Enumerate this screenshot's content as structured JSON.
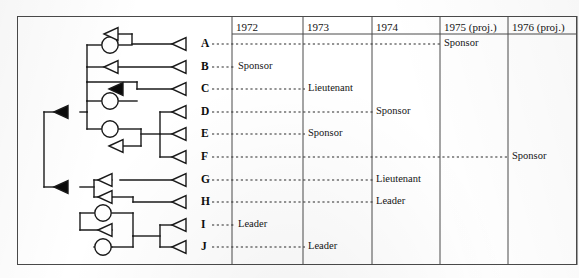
{
  "figure": {
    "type": "tree-timeline-diagram"
  },
  "table": {
    "columns": [
      {
        "label": "1972",
        "x0": 232,
        "x1": 303
      },
      {
        "label": "1973",
        "x0": 303,
        "x1": 372
      },
      {
        "label": "1974",
        "x0": 372,
        "x1": 440
      },
      {
        "label": "1975 (proj.)",
        "x0": 440,
        "x1": 508
      },
      {
        "label": "1976 (proj.)",
        "x0": 508,
        "x1": 577
      }
    ],
    "header_y": 16,
    "header_bottom_y": 34
  },
  "rows": [
    {
      "letter": "A",
      "y": 44,
      "label": "Sponsor",
      "label_x": 444,
      "dot_end": 441
    },
    {
      "letter": "B",
      "y": 67,
      "label": "Sponsor",
      "label_x": 238,
      "dot_end": 235
    },
    {
      "letter": "C",
      "y": 89,
      "label": "Lieutenant",
      "label_x": 308,
      "dot_end": 305
    },
    {
      "letter": "D",
      "y": 112,
      "label": "Sponsor",
      "label_x": 376,
      "dot_end": 373
    },
    {
      "letter": "E",
      "y": 134,
      "label": "Sponsor",
      "label_x": 308,
      "dot_end": 305
    },
    {
      "letter": "F",
      "y": 157,
      "label": "Sponsor",
      "label_x": 512,
      "dot_end": 509
    },
    {
      "letter": "G",
      "y": 180,
      "label": "Lieutenant",
      "label_x": 376,
      "dot_end": 373
    },
    {
      "letter": "H",
      "y": 202,
      "label": "Leader",
      "label_x": 376,
      "dot_end": 373
    },
    {
      "letter": "I",
      "y": 225,
      "label": "Leader",
      "label_x": 238,
      "dot_end": 235
    },
    {
      "letter": "J",
      "y": 247,
      "label": "Leader",
      "label_x": 308,
      "dot_end": 305
    }
  ],
  "nodes": {
    "terminal_triangles": [
      {
        "for": "A",
        "x": 186,
        "y": 44
      },
      {
        "for": "B",
        "x": 186,
        "y": 67
      },
      {
        "for": "C",
        "x": 186,
        "y": 89
      },
      {
        "for": "D",
        "x": 186,
        "y": 112
      },
      {
        "for": "E",
        "x": 186,
        "y": 134
      },
      {
        "for": "F",
        "x": 186,
        "y": 157
      },
      {
        "for": "G",
        "x": 186,
        "y": 180
      },
      {
        "for": "H",
        "x": 186,
        "y": 202
      },
      {
        "for": "I",
        "x": 186,
        "y": 225
      },
      {
        "for": "J",
        "x": 186,
        "y": 247
      }
    ],
    "open_triangles": [
      {
        "x": 118,
        "y": 34
      },
      {
        "x": 118,
        "y": 67
      },
      {
        "x": 123,
        "y": 146
      },
      {
        "x": 112,
        "y": 180
      },
      {
        "x": 112,
        "y": 197
      },
      {
        "x": 112,
        "y": 230
      }
    ],
    "filled_triangles": [
      {
        "x": 123,
        "y": 89
      },
      {
        "x": 68,
        "y": 112
      },
      {
        "x": 68,
        "y": 187
      }
    ],
    "circles": [
      {
        "x": 110,
        "y": 45
      },
      {
        "x": 110,
        "y": 101
      },
      {
        "x": 110,
        "y": 129
      },
      {
        "x": 103,
        "y": 213
      },
      {
        "x": 103,
        "y": 247
      }
    ]
  },
  "colors": {
    "line": "#1a1a1a",
    "frame": "#4a4a4a",
    "text": "#141414",
    "fill_node": "#0a0a0a",
    "paper": "#ffffff"
  }
}
